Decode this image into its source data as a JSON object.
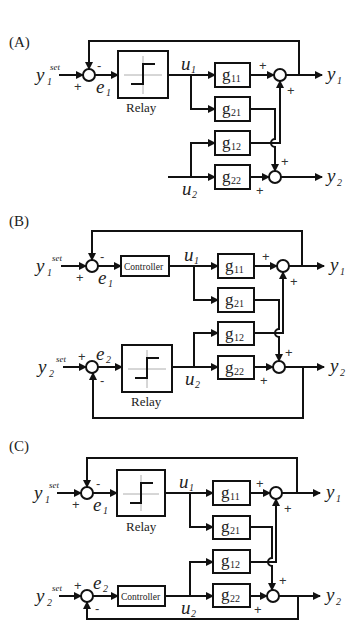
{
  "panels": [
    {
      "label": "(A)",
      "loop1": {
        "input": "y",
        "input_sub": "1",
        "input_sup": "set",
        "error": "e",
        "error_sub": "1",
        "block": "Relay",
        "u": "u",
        "u_sub": "1",
        "output": "y",
        "output_sub": "1",
        "sign_ref": "+",
        "sign_fb": "-"
      },
      "loop2": {
        "u": "u",
        "u_sub": "2",
        "output": "y",
        "output_sub": "2",
        "closed": false
      },
      "plant": {
        "g11": "11",
        "g21": "21",
        "g12": "12",
        "g22": "22",
        "g": "g",
        "sign_a": "+",
        "sign_b": "+",
        "sign_c": "+",
        "sign_d": "+"
      }
    },
    {
      "label": "(B)",
      "loop1": {
        "input": "y",
        "input_sub": "1",
        "input_sup": "set",
        "error": "e",
        "error_sub": "1",
        "block": "Controller",
        "u": "u",
        "u_sub": "1",
        "output": "y",
        "output_sub": "1",
        "sign_ref": "+",
        "sign_fb": "-"
      },
      "loop2": {
        "input": "y",
        "input_sub": "2",
        "input_sup": "set",
        "error": "e",
        "error_sub": "2",
        "block": "Relay",
        "u": "u",
        "u_sub": "2",
        "output": "y",
        "output_sub": "2",
        "sign_ref": "+",
        "sign_fb": "-",
        "closed": true
      },
      "plant": {
        "g11": "11",
        "g21": "21",
        "g12": "12",
        "g22": "22",
        "g": "g",
        "sign_a": "+",
        "sign_b": "+",
        "sign_c": "+",
        "sign_d": "+"
      }
    },
    {
      "label": "(C)",
      "loop1": {
        "input": "y",
        "input_sub": "1",
        "input_sup": "set",
        "error": "e",
        "error_sub": "1",
        "block": "Relay",
        "u": "u",
        "u_sub": "1",
        "output": "y",
        "output_sub": "1",
        "sign_ref": "+",
        "sign_fb": "-"
      },
      "loop2": {
        "input": "y",
        "input_sub": "2",
        "input_sup": "set",
        "error": "e",
        "error_sub": "2",
        "block": "Controller",
        "u": "u",
        "u_sub": "2",
        "output": "y",
        "output_sub": "2",
        "sign_ref": "+",
        "sign_fb": "-",
        "closed": true
      },
      "plant": {
        "g11": "11",
        "g21": "21",
        "g12": "12",
        "g22": "22",
        "g": "g",
        "sign_a": "+",
        "sign_b": "+",
        "sign_c": "+",
        "sign_d": "+"
      }
    }
  ],
  "colors": {
    "line": "#111111",
    "background": "#ffffff"
  }
}
